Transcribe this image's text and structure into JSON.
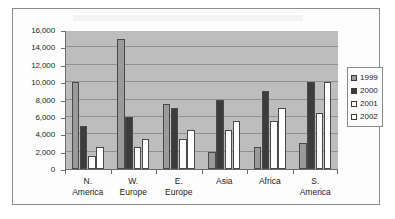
{
  "chart_data": {
    "type": "bar",
    "title": "",
    "subtitle": "",
    "xlabel": "",
    "ylabel": "",
    "categories": [
      "N. America",
      "W. Europe",
      "E. Europe",
      "Asia",
      "Africa",
      "S. America"
    ],
    "category_lines": [
      [
        "N.",
        "America"
      ],
      [
        "W.",
        "Europe"
      ],
      [
        "E.",
        "Europe"
      ],
      [
        "Asia",
        ""
      ],
      [
        "Africa",
        ""
      ],
      [
        "S.",
        "America"
      ]
    ],
    "series": [
      {
        "name": "1999",
        "color": "#9a9a9a",
        "values": [
          10000,
          15000,
          7500,
          2000,
          2500,
          3000
        ]
      },
      {
        "name": "2000",
        "color": "#3c3c3c",
        "values": [
          5000,
          6000,
          7000,
          8000,
          9000,
          10000
        ]
      },
      {
        "name": "2001",
        "color": "#fbfbfb",
        "values": [
          1500,
          2500,
          3500,
          4500,
          5500,
          6500
        ]
      },
      {
        "name": "2002",
        "color": "#ffffff",
        "values": [
          2500,
          3500,
          4500,
          5500,
          7000,
          10000
        ]
      }
    ],
    "ylim": [
      0,
      16000
    ],
    "ytick_step": 2000,
    "ytick_labels": [
      "0",
      "2,000",
      "4,000",
      "6,000",
      "8,000",
      "10,000",
      "12,000",
      "14,000",
      "16,000"
    ],
    "ytick_values": [
      0,
      2000,
      4000,
      6000,
      8000,
      10000,
      12000,
      14000,
      16000
    ],
    "grid": true,
    "legend_position": "right",
    "legend_entries": [
      "1999",
      "2000",
      "2001",
      "2002"
    ],
    "plot_background": "#bdbdbd",
    "gridline_color": "#8f8f8f",
    "axis_color": "#6e6e6e"
  }
}
